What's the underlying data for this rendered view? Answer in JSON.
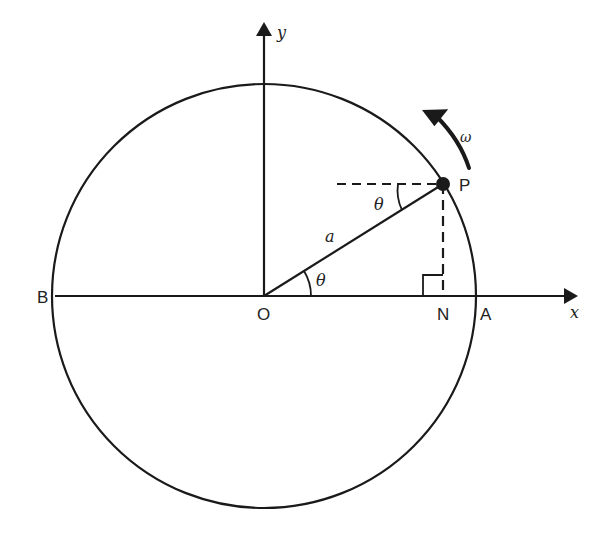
{
  "diagram": {
    "type": "circular-motion-geometry",
    "colors": {
      "stroke": "#1a1a1a",
      "background": "#ffffff"
    },
    "axes": {
      "x_label": "x",
      "y_label": "y"
    },
    "points": {
      "origin": "O",
      "point_on_circle": "P",
      "foot": "N",
      "right_intercept": "A",
      "left_intercept": "B"
    },
    "labels": {
      "radius": "a",
      "angle_at_origin": "θ",
      "angle_at_p": "θ",
      "angular_velocity": "ω"
    },
    "geometry": {
      "center": [
        264,
        296
      ],
      "radius": 211,
      "angle_deg": 32
    }
  }
}
